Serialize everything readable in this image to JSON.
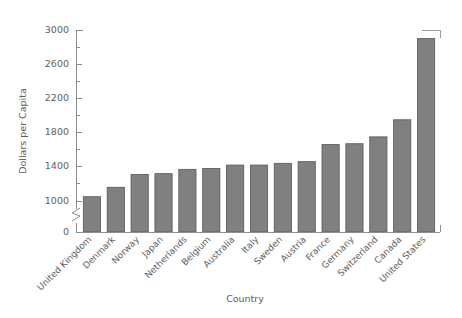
{
  "chart_data": {
    "type": "bar",
    "title": "",
    "xlabel": "Country",
    "ylabel": "Dollars per Capita",
    "categories": [
      "United Kingdom",
      "Denmark",
      "Norway",
      "Japan",
      "Netherlands",
      "Belgium",
      "Australia",
      "Italy",
      "Sweden",
      "Austria",
      "France",
      "Germany",
      "Switzerland",
      "Canada",
      "United States"
    ],
    "values": [
      1050,
      1160,
      1310,
      1320,
      1370,
      1380,
      1420,
      1420,
      1440,
      1460,
      1660,
      1670,
      1750,
      1950,
      2900
    ],
    "ylim": [
      1000,
      3000
    ],
    "y_baseline_label": "0",
    "y_axis_break": true,
    "ytick_labels": [
      "1000",
      "1400",
      "1800",
      "2200",
      "2600",
      "3000"
    ],
    "ytick_values": [
      1000,
      1400,
      1800,
      2200,
      2600,
      3000
    ],
    "yminor_values": [
      1200,
      1600,
      2000,
      2400,
      2800
    ],
    "grid": false,
    "legend": "none",
    "bar_color": "#808080",
    "bar_edge_color": "#5f5f5f",
    "axis_color": "#8d8d8d",
    "text_color": "#5e5e5e",
    "background_color": "#ffffff",
    "xtick_label_rotation": 45
  }
}
